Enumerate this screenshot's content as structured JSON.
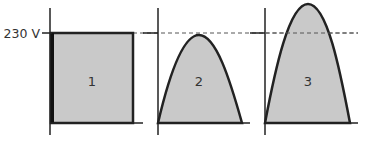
{
  "voltage_label": "230 V",
  "panels": [
    {
      "id": "1",
      "label": "1",
      "shape": "rectangle"
    },
    {
      "id": "2",
      "label": "2",
      "shape": "arch-peak-at-230V"
    },
    {
      "id": "3",
      "label": "3",
      "shape": "arch-peak-above-230V"
    }
  ],
  "colors": {
    "fill": "#c8c8c8",
    "stroke": "#222222",
    "dashed": "#555555"
  }
}
